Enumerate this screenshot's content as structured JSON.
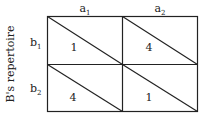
{
  "diagram": {
    "axis_label": "B's repertoire",
    "columns": [
      {
        "label": "a",
        "sub": "1"
      },
      {
        "label": "a",
        "sub": "2"
      }
    ],
    "rows": [
      {
        "label": "b",
        "sub": "1"
      },
      {
        "label": "b",
        "sub": "2"
      }
    ],
    "cells": [
      [
        "1",
        "4"
      ],
      [
        "4",
        "1"
      ]
    ],
    "line_color": "#222222"
  }
}
